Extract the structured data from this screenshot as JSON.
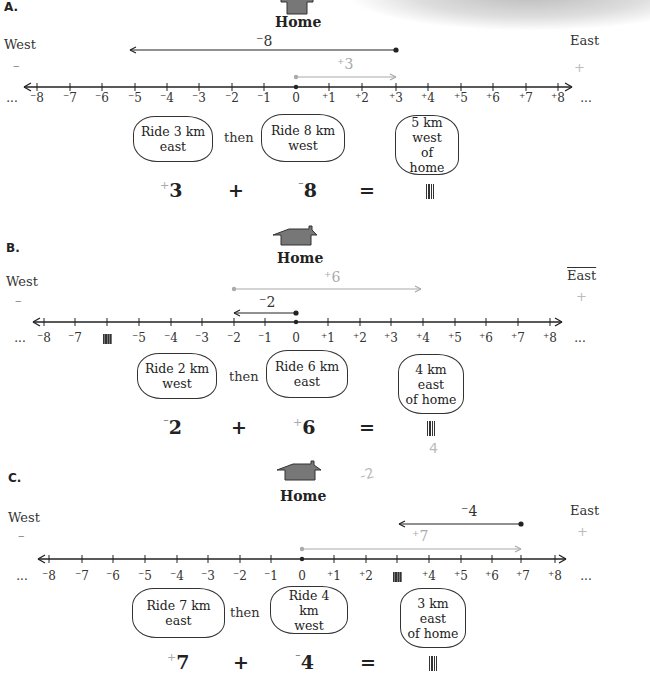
{
  "sections": [
    {
      "id": "A",
      "label": "A.",
      "home": "Home",
      "west": "West",
      "east": "East",
      "minus_sign": "–",
      "plus_sign": "+",
      "top_arrow": {
        "label": "⁻8",
        "from": 3,
        "to": -5,
        "color": "#222"
      },
      "bottom_arrow": {
        "label": "⁺3",
        "from": 0,
        "to": 3,
        "color": "#aaa"
      },
      "tick_labels": [
        "⁻8",
        "⁻7",
        "⁻6",
        "⁻5",
        "⁻4",
        "⁻3",
        "⁻2",
        "⁻1",
        "0",
        "⁺1",
        "⁺2",
        "⁺3",
        "⁺4",
        "⁺5",
        "⁺6",
        "⁺7",
        "⁺8"
      ],
      "hidden_tick": null,
      "ellipsis": "...",
      "cloud1": [
        "Ride 3 km",
        "east"
      ],
      "then": "then",
      "cloud2": [
        "Ride 8 km",
        "west"
      ],
      "result_cloud": [
        "5 km",
        "west",
        "of home"
      ],
      "equation": {
        "a_sign": "+",
        "a": "3",
        "op": "+",
        "b_sign": "⁻",
        "b": "8",
        "eq": "="
      }
    },
    {
      "id": "B",
      "label": "B.",
      "home": "Home",
      "west": "West",
      "east": "East",
      "minus_sign": "–",
      "plus_sign": "+",
      "top_arrow": {
        "label": "⁺6",
        "from": -2,
        "to": 4,
        "color": "#aaa"
      },
      "bottom_arrow": {
        "label": "⁻2",
        "from": 0,
        "to": -2,
        "color": "#222"
      },
      "tick_labels": [
        "⁻8",
        "⁻7",
        "",
        "⁻5",
        "⁻4",
        "⁻3",
        "⁻2",
        "⁻1",
        "0",
        "⁺1",
        "⁺2",
        "⁺3",
        "⁺4",
        "⁺5",
        "⁺6",
        "⁺7",
        "⁺8"
      ],
      "hidden_tick": -6,
      "ellipsis": "...",
      "cloud1": [
        "Ride 2 km",
        "west"
      ],
      "then": "then",
      "cloud2": [
        "Ride 6 km",
        "east"
      ],
      "result_cloud": [
        "4 km",
        "east",
        "of home"
      ],
      "equation": {
        "a_sign": "⁻",
        "a": "2",
        "op": "+",
        "b_sign": "+",
        "b": "6",
        "eq": "="
      },
      "handwriting": "4"
    },
    {
      "id": "C",
      "label": "C.",
      "home": "Home",
      "west": "West",
      "east": "East",
      "minus_sign": "–",
      "plus_sign": "+",
      "top_arrow": {
        "label": "⁻4",
        "from": 7,
        "to": 3,
        "color": "#222"
      },
      "bottom_arrow": {
        "label": "⁺7",
        "from": 0,
        "to": 7,
        "color": "#aaa"
      },
      "tick_labels": [
        "⁻8",
        "⁻7",
        "⁻6",
        "⁻5",
        "⁻4",
        "⁻3",
        "⁻2",
        "⁻1",
        "0",
        "⁺1",
        "⁺2",
        "",
        "⁺4",
        "⁺5",
        "⁺6",
        "⁺7",
        "⁺8"
      ],
      "hidden_tick": 3,
      "ellipsis": "...",
      "cloud1": [
        "Ride 7 km",
        "east"
      ],
      "then": "then",
      "cloud2": [
        "Ride 4 km",
        "west"
      ],
      "result_cloud": [
        "3 km",
        "east",
        "of home"
      ],
      "equation": {
        "a_sign": "+",
        "a": "7",
        "op": "+",
        "b_sign": "⁻",
        "b": "4",
        "eq": "="
      },
      "handwriting": "-2"
    }
  ]
}
